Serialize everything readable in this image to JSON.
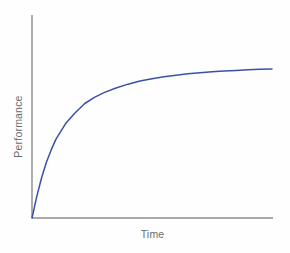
{
  "chart_data": {
    "type": "line",
    "title": "",
    "subtitle": "",
    "xlabel": "Time",
    "ylabel": "Performance",
    "grid": false,
    "legend": null,
    "legend_position": "none",
    "xlim": [
      0,
      100
    ],
    "ylim": [
      0,
      100
    ],
    "xticks": [],
    "yticks": [],
    "xticklabels": [],
    "yticklabels": [],
    "annotations": [],
    "series": [
      {
        "name": "Learning curve",
        "color": "#3b52a4",
        "linewidth": 1.5,
        "x": [
          0,
          2,
          4,
          6,
          8,
          10,
          14,
          18,
          22,
          26,
          30,
          35,
          40,
          45,
          50,
          55,
          60,
          65,
          70,
          75,
          80,
          85,
          90,
          95,
          100
        ],
        "y": [
          0,
          14,
          26,
          36,
          44,
          51,
          61,
          68,
          74,
          78,
          81,
          84,
          86.5,
          88.5,
          90,
          91.3,
          92.3,
          93.2,
          93.9,
          94.5,
          95,
          95.4,
          95.8,
          96.1,
          96.3
        ]
      }
    ]
  },
  "axes": {
    "axis_color": "#8d8d8d",
    "axis_linewidth": 1.4,
    "origin_px": [
      32,
      218
    ],
    "y_axis_top_px": 15,
    "x_axis_right_px": 273
  },
  "style": {
    "background": "#fefefe",
    "label_color": "#6b6b6b",
    "curve_color": "#3b52a4"
  }
}
